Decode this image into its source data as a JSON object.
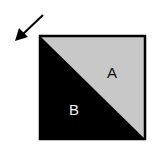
{
  "diagram": {
    "regions": [
      {
        "id": "A",
        "label": "A",
        "fill": "#c8c8c8",
        "text_color": "#111111",
        "position": "upper-right triangle"
      },
      {
        "id": "B",
        "label": "B",
        "fill": "#000000",
        "text_color": "#f0f0f0",
        "position": "lower-left triangle"
      }
    ],
    "square": {
      "x": 39,
      "y": 35,
      "size": 106,
      "border_color": "#000000"
    },
    "arrow": {
      "direction": "down-left",
      "color": "#000000"
    }
  }
}
